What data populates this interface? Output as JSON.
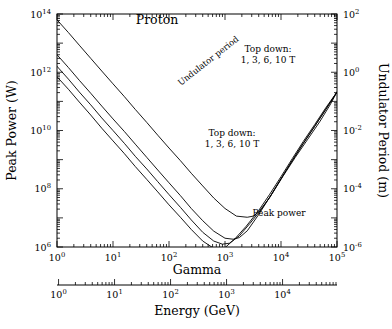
{
  "chart_data": {
    "type": "line",
    "title": "Proton",
    "xlabel": "Gamma",
    "xlabel2": "Energy (GeV)",
    "ylabel": "Peak Power (W)",
    "ylabel2": "Undulator Period (m)",
    "xlim": [
      1,
      100000
    ],
    "xlim2": [
      1,
      93808
    ],
    "ylim": [
      1000000.0,
      100000000000000.0
    ],
    "ylim2": [
      1e-06,
      100.0
    ],
    "xscale": "log",
    "yscale": "log",
    "grid": false,
    "legend": "none",
    "xticks": [
      "10^0",
      "10^1",
      "10^2",
      "10^3",
      "10^4",
      "10^5"
    ],
    "xtick_labels": [
      "10",
      "10",
      "10",
      "10",
      "10",
      "10"
    ],
    "xtick_exponents": [
      "0",
      "1",
      "2",
      "3",
      "4",
      "5"
    ],
    "xticks2_labels": [
      "10",
      "10",
      "10",
      "10",
      "10"
    ],
    "xticks2_exponents": [
      "0",
      "1",
      "2",
      "3",
      "4"
    ],
    "yticks_labels": [
      "10",
      "10",
      "10",
      "10",
      "10"
    ],
    "yticks_exponents": [
      "14",
      "12",
      "10",
      "8",
      "6"
    ],
    "yticks2_labels": [
      "10",
      "10",
      "10",
      "10",
      "10"
    ],
    "yticks2_exponents": [
      "2",
      "0",
      "-2",
      "-4",
      "-6"
    ],
    "annotations": [
      {
        "name": "undulator-period-label",
        "text": "Undulator period",
        "rotation": -38
      },
      {
        "name": "top-down-upper-line1",
        "text": "Top down:"
      },
      {
        "name": "top-down-upper-line2",
        "text": "1, 3, 6, 10 T"
      },
      {
        "name": "top-down-lower-line1",
        "text": "Top down:"
      },
      {
        "name": "top-down-lower-line2",
        "text": "1, 3, 6, 10 T"
      },
      {
        "name": "peak-power-label",
        "text": "Peak power"
      }
    ],
    "series": [
      {
        "name": "Peak power, B = 1 T",
        "field_T": 1,
        "group": "peak_power",
        "points": [
          [
            1,
            63000000000000.0
          ],
          [
            1.6,
            23000000000000.0
          ],
          [
            2.5,
            8500000000000.0
          ],
          [
            4,
            3000000000000.0
          ],
          [
            6.3,
            1100000000000.0
          ],
          [
            10,
            400000000000.0
          ],
          [
            16,
            145000000000.0
          ],
          [
            25,
            53000000000.0
          ],
          [
            40,
            19000000000.0
          ],
          [
            63,
            6900000000.0
          ],
          [
            100,
            2500000000.0
          ],
          [
            160,
            920000000.0
          ],
          [
            250,
            340000000.0
          ],
          [
            400,
            125000000.0
          ],
          [
            630,
            48000000.0
          ],
          [
            1000,
            21000000.0
          ],
          [
            1600,
            11500000.0
          ],
          [
            2500,
            10500000.0
          ],
          [
            3200,
            11500000.0
          ],
          [
            4000,
            16000000.0
          ],
          [
            6300,
            50000000.0
          ],
          [
            10000,
            220000000.0
          ],
          [
            16000,
            950000000.0
          ],
          [
            25000,
            3600000000.0
          ],
          [
            40000,
            14000000000.0
          ],
          [
            63000,
            53000000000.0
          ],
          [
            100000,
            210000000000.0
          ]
        ]
      },
      {
        "name": "Peak power, B = 3 T",
        "field_T": 3,
        "group": "peak_power",
        "points": [
          [
            1,
            4000000000000.0
          ],
          [
            1.6,
            1450000000000.0
          ],
          [
            2.5,
            530000000000.0
          ],
          [
            4,
            190000000000.0
          ],
          [
            6.3,
            69000000000.0
          ],
          [
            10,
            25000000000.0
          ],
          [
            16,
            9200000000.0
          ],
          [
            25,
            3400000000.0
          ],
          [
            40,
            1200000000.0
          ],
          [
            63,
            440000000.0
          ],
          [
            100,
            160000000.0
          ],
          [
            160,
            58000000.0
          ],
          [
            250,
            21000000.0
          ],
          [
            400,
            8000000.0
          ],
          [
            630,
            3500000.0
          ],
          [
            1000,
            2000000.0
          ],
          [
            1400,
            1850000.0
          ],
          [
            1800,
            2100000.0
          ],
          [
            2500,
            3600000.0
          ],
          [
            4000,
            13000000.0
          ],
          [
            6300,
            52000000.0
          ],
          [
            10000,
            220000000.0
          ],
          [
            16000,
            950000000.0
          ],
          [
            25000,
            3600000000.0
          ],
          [
            40000,
            14000000000.0
          ],
          [
            63000,
            53000000000.0
          ],
          [
            100000,
            210000000000.0
          ]
        ]
      },
      {
        "name": "Peak power, B = 6 T",
        "field_T": 6,
        "group": "peak_power",
        "points": [
          [
            1,
            1600000000000.0
          ],
          [
            1.6,
            580000000000.0
          ],
          [
            2.5,
            210000000000.0
          ],
          [
            4,
            76000000000.0
          ],
          [
            6.3,
            27000000000.0
          ],
          [
            10,
            10000000000.0
          ],
          [
            16,
            3600000000.0
          ],
          [
            25,
            1300000000.0
          ],
          [
            40,
            480000000.0
          ],
          [
            63,
            175000000.0
          ],
          [
            100,
            63000000.0
          ],
          [
            160,
            23000000.0
          ],
          [
            250,
            8500000.0
          ],
          [
            400,
            3200000.0
          ],
          [
            630,
            1600000.0
          ],
          [
            900,
            1250000.0
          ],
          [
            1200,
            1350000.0
          ],
          [
            1800,
            2400000.0
          ],
          [
            2800,
            6500000.0
          ],
          [
            4500,
            20000000.0
          ],
          [
            7000,
            70000000.0
          ],
          [
            11000,
            280000000.0
          ],
          [
            18000,
            1200000000.0
          ],
          [
            30000,
            5000000000.0
          ],
          [
            50000,
            21000000000.0
          ],
          [
            75000,
            75000000000.0
          ],
          [
            100000,
            210000000000.0
          ]
        ]
      },
      {
        "name": "Peak power, B = 10 T",
        "field_T": 10,
        "group": "peak_power",
        "points": [
          [
            1,
            700000000000.0
          ],
          [
            1.6,
            260000000000.0
          ],
          [
            2.5,
            95000000000.0
          ],
          [
            4,
            34000000000.0
          ],
          [
            6.3,
            12000000000.0
          ],
          [
            10,
            4400000000.0
          ],
          [
            16,
            1600000000.0
          ],
          [
            25,
            580000000.0
          ],
          [
            40,
            210000000.0
          ],
          [
            63,
            78000000.0
          ],
          [
            100,
            28000000.0
          ],
          [
            160,
            10500000.0
          ],
          [
            250,
            4000000.0
          ],
          [
            400,
            1600000.0
          ],
          [
            630,
            900000.0
          ],
          [
            800,
            850000.0
          ],
          [
            1000,
            950000.0
          ],
          [
            1500,
            1900000.0
          ],
          [
            2400,
            5200000.0
          ],
          [
            4000,
            18000000.0
          ],
          [
            6300,
            65000000.0
          ],
          [
            10000,
            260000000.0
          ],
          [
            16000,
            1100000000.0
          ],
          [
            25000,
            4200000000.0
          ],
          [
            40000,
            16000000000.0
          ],
          [
            63000,
            60000000000.0
          ],
          [
            100000,
            210000000000.0
          ]
        ]
      },
      {
        "name": "Undulator period, B = 1 T",
        "field_T": 1,
        "group": "undulator_period",
        "points": [
          [
            1,
            1.1e-06
          ],
          [
            2,
            4.5e-06
          ],
          [
            4,
            1.8e-05
          ],
          [
            8,
            7e-05
          ],
          [
            16,
            0.00028
          ],
          [
            32,
            0.0011
          ],
          [
            63,
            0.0044
          ],
          [
            125,
            0.0175
          ],
          [
            250,
            0.07
          ],
          [
            500,
            0.26
          ],
          [
            800,
            0.6
          ],
          [
            1200,
            1.15
          ],
          [
            1800,
            2.1
          ],
          [
            2800,
            4.0
          ],
          [
            4500,
            8.0
          ],
          [
            7000,
            14
          ],
          [
            11000,
            23
          ],
          [
            18000,
            36
          ],
          [
            30000,
            54
          ],
          [
            50000,
            75
          ],
          [
            75000,
            93
          ],
          [
            100000,
            105
          ]
        ]
      },
      {
        "name": "Undulator period, B = 3 T",
        "field_T": 3,
        "group": "undulator_period",
        "points": [
          [
            1,
            1.1e-06
          ],
          [
            2,
            4.5e-06
          ],
          [
            4,
            1.8e-05
          ],
          [
            8,
            7e-05
          ],
          [
            16,
            0.00028
          ],
          [
            32,
            0.0011
          ],
          [
            63,
            0.0044
          ],
          [
            125,
            0.0175
          ],
          [
            250,
            0.07
          ],
          [
            500,
            0.26
          ],
          [
            800,
            0.58
          ],
          [
            1200,
            1.05
          ],
          [
            1800,
            1.8
          ],
          [
            2800,
            3.2
          ],
          [
            4500,
            6.0
          ],
          [
            7000,
            10
          ],
          [
            11000,
            16
          ],
          [
            18000,
            25
          ],
          [
            30000,
            38
          ],
          [
            50000,
            55
          ],
          [
            75000,
            70
          ],
          [
            100000,
            80
          ]
        ]
      },
      {
        "name": "Undulator period, B = 6 T",
        "field_T": 6,
        "group": "undulator_period",
        "points": [
          [
            1,
            1.1e-06
          ],
          [
            2,
            4.5e-06
          ],
          [
            4,
            1.8e-05
          ],
          [
            8,
            7e-05
          ],
          [
            16,
            0.00028
          ],
          [
            32,
            0.0011
          ],
          [
            63,
            0.0044
          ],
          [
            125,
            0.0175
          ],
          [
            250,
            0.07
          ],
          [
            500,
            0.255
          ],
          [
            800,
            0.55
          ],
          [
            1200,
            0.95
          ],
          [
            1800,
            1.6
          ],
          [
            2800,
            2.7
          ],
          [
            4500,
            4.8
          ],
          [
            7000,
            7.8
          ],
          [
            11000,
            12
          ],
          [
            18000,
            19
          ],
          [
            30000,
            29
          ],
          [
            50000,
            43
          ],
          [
            75000,
            55
          ],
          [
            100000,
            63
          ]
        ]
      },
      {
        "name": "Undulator period, B = 10 T",
        "field_T": 10,
        "group": "undulator_period",
        "points": [
          [
            1,
            1.1e-06
          ],
          [
            2,
            4.5e-06
          ],
          [
            4,
            1.8e-05
          ],
          [
            8,
            7e-05
          ],
          [
            16,
            0.00028
          ],
          [
            32,
            0.0011
          ],
          [
            63,
            0.0044
          ],
          [
            125,
            0.0175
          ],
          [
            250,
            0.068
          ],
          [
            500,
            0.24
          ],
          [
            800,
            0.5
          ],
          [
            1200,
            0.85
          ],
          [
            1800,
            1.4
          ],
          [
            2800,
            2.3
          ],
          [
            4500,
            3.9
          ],
          [
            7000,
            6.2
          ],
          [
            11000,
            9.5
          ],
          [
            18000,
            15
          ],
          [
            30000,
            23
          ],
          [
            50000,
            34
          ],
          [
            75000,
            44
          ],
          [
            100000,
            50
          ]
        ]
      }
    ]
  }
}
